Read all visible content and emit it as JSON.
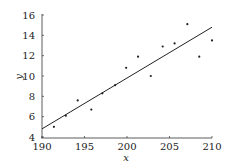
{
  "chart_data": {
    "type": "scatter",
    "title": "",
    "xlabel": "x",
    "ylabel": "y",
    "xlim": [
      190,
      210
    ],
    "ylim": [
      4,
      16
    ],
    "xticks": [
      190,
      195,
      200,
      205,
      210
    ],
    "yticks": [
      4,
      6,
      8,
      10,
      12,
      14,
      16
    ],
    "grid": false,
    "legend": null,
    "series": [
      {
        "name": "observations",
        "kind": "scatter",
        "x": [
          191.4,
          192.8,
          194.2,
          195.8,
          197.1,
          198.6,
          199.9,
          201.3,
          202.8,
          204.2,
          205.6,
          207.1,
          208.5,
          210.0
        ],
        "y": [
          5.0,
          6.1,
          7.6,
          6.7,
          8.3,
          9.1,
          10.8,
          11.9,
          10.0,
          12.9,
          13.2,
          15.1,
          11.9,
          13.5
        ]
      },
      {
        "name": "regression line",
        "kind": "line",
        "x": [
          190,
          210
        ],
        "y": [
          4.8,
          14.8
        ]
      }
    ]
  },
  "colors": {
    "points": "#222222",
    "line": "#222222",
    "axis": "#333333"
  }
}
